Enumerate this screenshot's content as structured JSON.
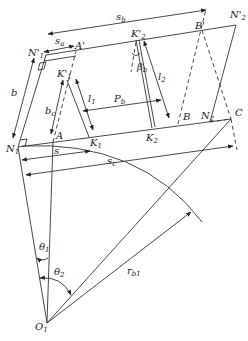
{
  "diagram": {
    "title": "",
    "colors": {
      "line": "#333333",
      "background": "#ffffff"
    },
    "points": {
      "O1": {
        "label": "O",
        "sub": "1",
        "x": 47,
        "y": 323
      },
      "N1": {
        "label": "N",
        "sub": "1",
        "x": 18,
        "y": 147
      },
      "N1p": {
        "label": "N'",
        "sub": "1",
        "x": 46,
        "y": 55
      },
      "A": {
        "label": "A",
        "x": 53,
        "y": 142
      },
      "Ap": {
        "label": "A'",
        "x": 76,
        "y": 51
      },
      "K1": {
        "label": "K",
        "sub": "1",
        "x": 89,
        "y": 137
      },
      "K1p": {
        "label": "K'",
        "sub": "1",
        "x": 67,
        "y": 78
      },
      "K2": {
        "label": "K",
        "sub": "2",
        "x": 152,
        "y": 128
      },
      "K2p": {
        "label": "K'",
        "sub": "2",
        "x": 136,
        "y": 38
      },
      "B": {
        "label": "B",
        "x": 178,
        "y": 124
      },
      "Bp": {
        "label": "B'",
        "x": 202,
        "y": 30
      },
      "N2": {
        "label": "N",
        "sub": "2",
        "x": 210,
        "y": 122
      },
      "N2p": {
        "label": "N'",
        "sub": "2",
        "x": 236,
        "y": 25
      },
      "C": {
        "label": "C",
        "x": 231,
        "y": 119
      }
    },
    "dimensions": {
      "s_b": {
        "label": "s",
        "sub": "b"
      },
      "s_a": {
        "label": "s",
        "sub": "a"
      },
      "b": {
        "label": "b"
      },
      "b_c": {
        "label": "b",
        "sub": "c"
      },
      "l_1": {
        "label": "l",
        "sub": "1"
      },
      "l_2": {
        "label": "l",
        "sub": "2"
      },
      "P_b": {
        "label": "P",
        "sub": "b"
      },
      "beta_b": {
        "label": "β",
        "sub": "b"
      },
      "s": {
        "label": "s"
      },
      "s_c": {
        "label": "s",
        "sub": "c"
      },
      "theta_1": {
        "label": "θ",
        "sub": "1"
      },
      "theta_2": {
        "label": "θ",
        "sub": "2"
      },
      "r_b1": {
        "label": "r",
        "sub": "b1"
      }
    }
  }
}
